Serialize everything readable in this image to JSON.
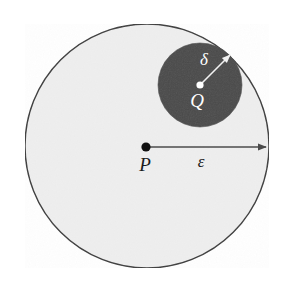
{
  "figure": {
    "background_color": "#ffffff",
    "width": 285,
    "height": 294
  },
  "outer_region": {
    "name": "epsilon-neighborhood",
    "fill_color": "#eeeeee",
    "stroke_color": "#3b3b3b",
    "stroke_width": 1.4,
    "center_x": 147,
    "center_y": 146,
    "radius": 122
  },
  "inner_region": {
    "name": "delta-neighborhood",
    "fill_color": "#4a4a4a",
    "stroke_color": "#4a4a4a",
    "stroke_width": 0,
    "center_x": 200,
    "center_y": 85,
    "radius": 42
  },
  "points": [
    {
      "id": "P",
      "label": "P",
      "label_color": "#1a1a1a",
      "dot_color": "#111111",
      "dot_radius": 4.6,
      "x": 146,
      "y": 147,
      "label_x": 145,
      "label_y": 167,
      "label_size": 19
    },
    {
      "id": "Q",
      "label": "Q",
      "label_color": "#ffffff",
      "dot_color": "#ffffff",
      "dot_radius": 3.6,
      "x": 200,
      "y": 85,
      "label_x": 197,
      "label_y": 103,
      "label_size": 19
    }
  ],
  "radii": [
    {
      "id": "epsilon",
      "label": "ε",
      "label_color": "#1a1a1a",
      "line_color": "#4b4b4b",
      "line_width": 1.5,
      "x1": 146,
      "y1": 147,
      "x2": 266,
      "y2": 147,
      "label_x": 201,
      "label_y": 163,
      "label_size": 17
    },
    {
      "id": "delta",
      "label": "δ",
      "label_color": "#ffffff",
      "line_color": "#f2f2f2",
      "line_width": 1.6,
      "x1": 200,
      "y1": 85,
      "x2": 230,
      "y2": 55,
      "label_x": 204,
      "label_y": 61,
      "label_size": 17
    }
  ]
}
